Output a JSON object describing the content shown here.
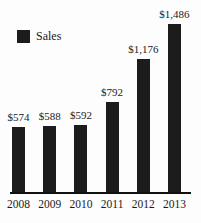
{
  "chart_data": {
    "type": "bar",
    "categories": [
      "2008",
      "2009",
      "2010",
      "2011",
      "2012",
      "2013"
    ],
    "values": [
      574,
      588,
      592,
      792,
      1176,
      1486
    ],
    "value_labels": [
      "$574",
      "$588",
      "$592",
      "$792",
      "$1,176",
      "$1,486"
    ],
    "series_name": "Sales",
    "legend": {
      "label": "Sales",
      "position": "top-left"
    },
    "xlabel": "",
    "ylabel": "",
    "ylim": [
      0,
      1486
    ],
    "grid": false,
    "colors": {
      "bar": "#1c1c1c",
      "axis": "#111111",
      "text": "#1b1b1b",
      "background": "#fdfdfd"
    }
  }
}
